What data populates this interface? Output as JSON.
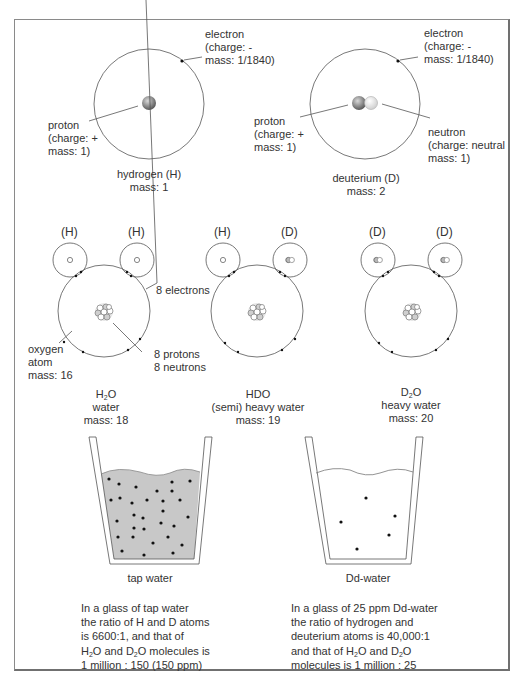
{
  "atoms": {
    "hydrogen": {
      "electron_label": [
        "electron",
        "(charge: -",
        "mass: 1/1840)"
      ],
      "proton_label": [
        "proton",
        "(charge: +",
        "mass: 1)"
      ],
      "name": "hydrogen (H)",
      "mass": "mass: 1"
    },
    "deuterium": {
      "electron_label": [
        "electron",
        "(charge: -",
        "mass: 1/1840)"
      ],
      "proton_label": [
        "proton",
        "(charge: +",
        "mass: 1)"
      ],
      "neutron_label": [
        "neutron",
        "(charge: neutral",
        "mass: 1)"
      ],
      "name": "deuterium (D)",
      "mass": "mass: 2"
    }
  },
  "molecules": [
    {
      "h_labels": [
        "(H)",
        "(H)"
      ],
      "formula_main": "H",
      "formula_sub": "2",
      "formula_end": "O",
      "name": "water",
      "mass": "mass: 18"
    },
    {
      "h_labels": [
        "(H)",
        "(D)"
      ],
      "formula_main": "HDO",
      "formula_sub": "",
      "formula_end": "",
      "name": "(semi) heavy water",
      "mass": "mass: 19"
    },
    {
      "h_labels": [
        "(D)",
        "(D)"
      ],
      "formula_main": "D",
      "formula_sub": "2",
      "formula_end": "O",
      "name": "heavy water",
      "mass": "mass: 20"
    }
  ],
  "oxygen_annotations": {
    "electrons": "8 electrons",
    "oxygen": [
      "oxygen",
      "atom",
      "mass: 16"
    ],
    "nucleus": [
      "8 protons",
      "8 neutrons"
    ]
  },
  "glasses": [
    {
      "title": "tap water",
      "fill_color": "#c8c8c8",
      "molecule_count": 30,
      "description": [
        "In a glass of tap water",
        "the ratio of H and D atoms",
        "is 6600:1, and that of",
        [
          "H",
          "2",
          "O and D",
          "2",
          "O molecules is"
        ],
        "1 million : 150  (150 ppm)"
      ]
    },
    {
      "title": "Dd-water",
      "fill_color": "#ffffff",
      "molecule_count": 5,
      "description": [
        "In a glass of 25 ppm Dd-water",
        "the ratio of hydrogen and",
        "deuterium atoms is 40,000:1",
        [
          "and that of H",
          "2",
          "O and D",
          "2",
          "O"
        ],
        "molecules is 1 million : 25"
      ]
    }
  ]
}
